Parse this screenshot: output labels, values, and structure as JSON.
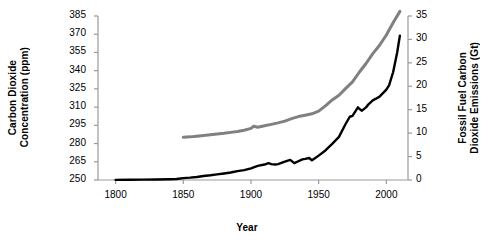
{
  "chart_data": {
    "type": "line",
    "title": "",
    "xlabel": "Year",
    "ylabel_left": "Carbon Dioxide Concentration (ppm)",
    "ylabel_right": "Fossil Fuel Carbon Dioxide Emissions (Gt)",
    "xlim": [
      1787,
      2016
    ],
    "ylim_left": [
      250,
      385
    ],
    "ylim_right": [
      0,
      35
    ],
    "grid": false,
    "legend": "none",
    "xticks": [
      1800,
      1850,
      1900,
      1950,
      2000
    ],
    "xtick_labels": [
      "1800",
      "1850",
      "1900",
      "1950",
      "2000"
    ],
    "yticks_left": [
      250,
      265,
      280,
      295,
      310,
      325,
      340,
      355,
      370,
      385
    ],
    "ytick_labels_left": [
      "250",
      "265",
      "280",
      "295",
      "310",
      "325",
      "340",
      "355",
      "370",
      "385"
    ],
    "yticks_right": [
      0,
      5,
      10,
      15,
      20,
      25,
      30,
      35
    ],
    "ytick_labels_right": [
      "0",
      "5",
      "10",
      "15",
      "20",
      "25",
      "30",
      "35"
    ],
    "series": [
      {
        "name": "Carbon Dioxide Concentration (ppm)",
        "axis": "left",
        "color": "#808080",
        "linewidth": 3,
        "x": [
          1850,
          1855,
          1860,
          1865,
          1870,
          1875,
          1880,
          1885,
          1890,
          1895,
          1900,
          1902,
          1905,
          1910,
          1915,
          1920,
          1925,
          1930,
          1935,
          1940,
          1945,
          1950,
          1955,
          1960,
          1965,
          1970,
          1975,
          1980,
          1985,
          1990,
          1995,
          2000,
          2005,
          2010
        ],
        "y": [
          285.2,
          285.5,
          286.0,
          286.6,
          287.2,
          287.8,
          288.4,
          289.2,
          290.0,
          291.0,
          292.5,
          294.2,
          293.4,
          294.6,
          295.8,
          297.0,
          298.5,
          300.5,
          302.2,
          303.3,
          304.5,
          306.7,
          311.0,
          315.9,
          319.8,
          325.4,
          330.8,
          338.7,
          345.9,
          354.0,
          360.9,
          369.4,
          379.5,
          388.8
        ]
      },
      {
        "name": "Fossil Fuel Carbon Dioxide Emissions (Gt)",
        "axis": "right",
        "color": "#000000",
        "linewidth": 2.4,
        "x": [
          1800,
          1810,
          1820,
          1830,
          1840,
          1845,
          1850,
          1855,
          1860,
          1865,
          1870,
          1875,
          1880,
          1885,
          1890,
          1895,
          1900,
          1905,
          1910,
          1913,
          1915,
          1918,
          1920,
          1925,
          1929,
          1932,
          1935,
          1938,
          1940,
          1943,
          1945,
          1947,
          1950,
          1955,
          1960,
          1965,
          1970,
          1973,
          1975,
          1979,
          1980,
          1982,
          1985,
          1987,
          1990,
          1992,
          1995,
          2000,
          2002,
          2005,
          2008,
          2010
        ],
        "y": [
          0.03,
          0.05,
          0.07,
          0.1,
          0.15,
          0.2,
          0.4,
          0.5,
          0.65,
          0.85,
          1.0,
          1.2,
          1.4,
          1.6,
          1.9,
          2.1,
          2.5,
          3.0,
          3.3,
          3.6,
          3.4,
          3.3,
          3.4,
          3.9,
          4.3,
          3.6,
          4.0,
          4.4,
          4.5,
          4.7,
          4.2,
          4.6,
          5.2,
          6.3,
          7.7,
          9.2,
          12.0,
          13.5,
          13.7,
          15.5,
          15.2,
          14.8,
          15.5,
          16.2,
          17.0,
          17.3,
          17.8,
          19.3,
          20.2,
          23.0,
          27.2,
          30.8
        ]
      }
    ],
    "annotations": []
  },
  "axes": {
    "x_title": "Year",
    "y_left_title_line1": "Carbon Dioxide",
    "y_left_title_line2": "Concentration (ppm)",
    "y_right_title_line1": "Fossil Fuel Carbon",
    "y_right_title_line2": "Dioxide Emissions (Gt)"
  }
}
